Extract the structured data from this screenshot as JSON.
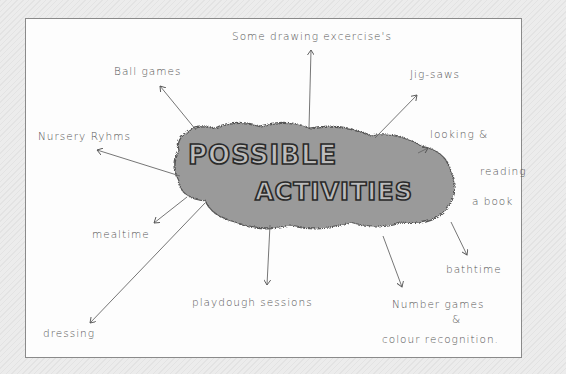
{
  "diagram": {
    "type": "mind-map",
    "center": {
      "line1": "POSSIBLE",
      "line2": "ACTIVITIES"
    },
    "nodes": [
      {
        "id": "drawing",
        "label": "Some drawing excercise's"
      },
      {
        "id": "ball",
        "label": "Ball games"
      },
      {
        "id": "jigsaws",
        "label": "Jig-saws"
      },
      {
        "id": "nursery",
        "label": "Nursery Ryhms"
      },
      {
        "id": "looking1",
        "label": "looking &"
      },
      {
        "id": "looking2",
        "label": "reading"
      },
      {
        "id": "looking3",
        "label": "a book"
      },
      {
        "id": "mealtime",
        "label": "mealtime"
      },
      {
        "id": "bathtime",
        "label": "bathtime"
      },
      {
        "id": "playdough",
        "label": "playdough sessions"
      },
      {
        "id": "number1",
        "label": "Number games"
      },
      {
        "id": "number2",
        "label": "&"
      },
      {
        "id": "number3",
        "label": "colour recognition."
      },
      {
        "id": "dressing",
        "label": "dressing"
      }
    ],
    "colors": {
      "cloud_fill": "#9a9a9a",
      "letter_fill": "#bdbdbd",
      "outline": "#2a2a2a",
      "pencil": "#555555"
    }
  }
}
